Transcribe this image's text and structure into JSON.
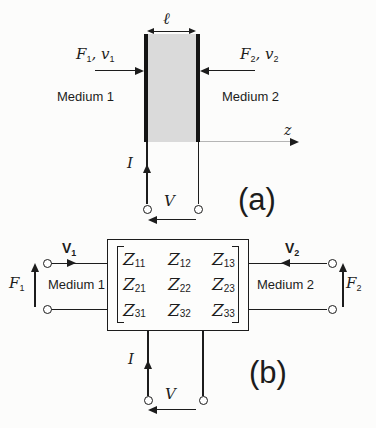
{
  "colors": {
    "ink": "#1c1c1c",
    "slab_fill": "#dadada",
    "axis_line": "#b5b5b5",
    "background": "#fcfcfb"
  },
  "panel_a": {
    "caption": "(a)",
    "length_label": "ℓ",
    "left_force": {
      "b1": "F",
      "s1": "1",
      "sep": ", ",
      "b2": "v",
      "s2": "1"
    },
    "right_force": {
      "b1": "F",
      "s1": "2",
      "sep": ", ",
      "b2": "v",
      "s2": "2"
    },
    "medium1": "Medium 1",
    "medium2": "Medium 2",
    "axis_label": "z",
    "current_label": "I",
    "voltage_label": "V"
  },
  "panel_b": {
    "caption": "(b)",
    "v1": {
      "b": "V",
      "s": "1"
    },
    "v2": {
      "b": "V",
      "s": "2"
    },
    "f1": {
      "b": "F",
      "s": "1"
    },
    "f2": {
      "b": "F",
      "s": "2"
    },
    "medium1": "Medium 1",
    "medium2": "Medium 2",
    "current_label": "I",
    "voltage_label": "V",
    "matrix": {
      "entries": [
        {
          "b": "Z",
          "s": "11"
        },
        {
          "b": "Z",
          "s": "12"
        },
        {
          "b": "Z",
          "s": "13"
        },
        {
          "b": "Z",
          "s": "21"
        },
        {
          "b": "Z",
          "s": "22"
        },
        {
          "b": "Z",
          "s": "23"
        },
        {
          "b": "Z",
          "s": "31"
        },
        {
          "b": "Z",
          "s": "32"
        },
        {
          "b": "Z",
          "s": "33"
        }
      ]
    }
  }
}
